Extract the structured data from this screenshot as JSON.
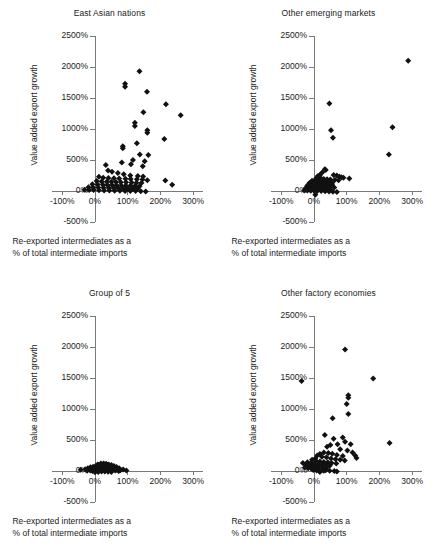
{
  "figure": {
    "background": "#ffffff",
    "marker_color": "#111111",
    "axis_color": "#7a7a7a",
    "panel_count": 4
  },
  "axis": {
    "xlabel_line1": "Re-exported intermediates as a",
    "xlabel_line2": "% of total intermediate imports",
    "ylabel": "Value added export growth",
    "xticks": [
      "-100%",
      "0%",
      "100%",
      "200%",
      "300%"
    ],
    "xtick_values": [
      -100,
      0,
      100,
      200,
      300
    ],
    "yticks": [
      "2500%",
      "2000%",
      "1500%",
      "1000%",
      "500%",
      "0%",
      "-500%"
    ],
    "ytick_values": [
      2500,
      2000,
      1500,
      1000,
      500,
      0,
      -500
    ],
    "xlim": [
      -130,
      330
    ],
    "ylim": [
      -500,
      2500
    ]
  },
  "chart_data": [
    {
      "type": "scatter",
      "title": "East Asian nations",
      "xlabel": "Re-exported intermediates as a % of total intermediate imports",
      "ylabel": "Value added export growth",
      "xlim": [
        -130,
        330
      ],
      "ylim": [
        -500,
        2500
      ],
      "grid": false,
      "legend": "none",
      "marker": "diamond",
      "points": [
        [
          136,
          1930
        ],
        [
          92,
          1730
        ],
        [
          92,
          1680
        ],
        [
          159,
          1600
        ],
        [
          217,
          1400
        ],
        [
          148,
          1270
        ],
        [
          122,
          1100
        ],
        [
          122,
          1050
        ],
        [
          262,
          1220
        ],
        [
          160,
          980
        ],
        [
          160,
          940
        ],
        [
          212,
          840
        ],
        [
          128,
          770
        ],
        [
          85,
          720
        ],
        [
          85,
          690
        ],
        [
          137,
          590
        ],
        [
          163,
          580
        ],
        [
          116,
          500
        ],
        [
          152,
          480
        ],
        [
          82,
          460
        ],
        [
          110,
          430
        ],
        [
          33,
          420
        ],
        [
          146,
          400
        ],
        [
          40,
          330
        ],
        [
          52,
          310
        ],
        [
          70,
          290
        ],
        [
          88,
          270
        ],
        [
          108,
          250
        ],
        [
          131,
          240
        ],
        [
          147,
          235
        ],
        [
          12,
          230
        ],
        [
          25,
          215
        ],
        [
          41,
          210
        ],
        [
          58,
          205
        ],
        [
          74,
          200
        ],
        [
          93,
          198
        ],
        [
          109,
          195
        ],
        [
          128,
          190
        ],
        [
          145,
          185
        ],
        [
          160,
          175
        ],
        [
          215,
          170
        ],
        [
          5,
          160
        ],
        [
          20,
          155
        ],
        [
          36,
          150
        ],
        [
          50,
          148
        ],
        [
          64,
          145
        ],
        [
          79,
          142
        ],
        [
          95,
          140
        ],
        [
          112,
          138
        ],
        [
          127,
          135
        ],
        [
          142,
          130
        ],
        [
          236,
          100
        ],
        [
          -8,
          110
        ],
        [
          8,
          105
        ],
        [
          24,
          100
        ],
        [
          38,
          98
        ],
        [
          52,
          95
        ],
        [
          66,
          92
        ],
        [
          80,
          90
        ],
        [
          94,
          88
        ],
        [
          108,
          85
        ],
        [
          122,
          82
        ],
        [
          136,
          78
        ],
        [
          -20,
          60
        ],
        [
          -6,
          58
        ],
        [
          10,
          55
        ],
        [
          26,
          52
        ],
        [
          42,
          50
        ],
        [
          57,
          48
        ],
        [
          71,
          45
        ],
        [
          86,
          42
        ],
        [
          100,
          40
        ],
        [
          115,
          38
        ],
        [
          130,
          35
        ],
        [
          -32,
          20
        ],
        [
          -18,
          18
        ],
        [
          -4,
          15
        ],
        [
          12,
          12
        ],
        [
          28,
          10
        ],
        [
          44,
          8
        ],
        [
          60,
          5
        ],
        [
          76,
          4
        ],
        [
          92,
          2
        ],
        [
          108,
          0
        ],
        [
          124,
          -2
        ],
        [
          140,
          -5
        ],
        [
          155,
          -10
        ]
      ]
    },
    {
      "type": "scatter",
      "title": "Other emerging markets",
      "xlabel": "Re-exported intermediates as a % of total intermediate imports",
      "ylabel": "Value added export growth",
      "xlim": [
        -130,
        330
      ],
      "ylim": [
        -500,
        2500
      ],
      "grid": false,
      "legend": "none",
      "marker": "diamond",
      "points": [
        [
          288,
          2100
        ],
        [
          47,
          1410
        ],
        [
          240,
          1030
        ],
        [
          52,
          980
        ],
        [
          58,
          860
        ],
        [
          229,
          590
        ],
        [
          108,
          200
        ],
        [
          33,
          350
        ],
        [
          36,
          340
        ],
        [
          78,
          230
        ],
        [
          84,
          220
        ],
        [
          90,
          215
        ],
        [
          70,
          250
        ],
        [
          60,
          260
        ],
        [
          25,
          300
        ],
        [
          18,
          260
        ],
        [
          12,
          240
        ],
        [
          8,
          215
        ],
        [
          14,
          205
        ],
        [
          22,
          200
        ],
        [
          30,
          195
        ],
        [
          40,
          190
        ],
        [
          50,
          185
        ],
        [
          64,
          180
        ],
        [
          75,
          175
        ],
        [
          2,
          175
        ],
        [
          -6,
          165
        ],
        [
          6,
          160
        ],
        [
          16,
          155
        ],
        [
          26,
          150
        ],
        [
          36,
          145
        ],
        [
          46,
          140
        ],
        [
          56,
          135
        ],
        [
          -14,
          130
        ],
        [
          -4,
          125
        ],
        [
          8,
          120
        ],
        [
          20,
          115
        ],
        [
          32,
          110
        ],
        [
          44,
          105
        ],
        [
          55,
          100
        ],
        [
          -20,
          90
        ],
        [
          -10,
          85
        ],
        [
          0,
          80
        ],
        [
          12,
          75
        ],
        [
          24,
          70
        ],
        [
          36,
          65
        ],
        [
          48,
          60
        ],
        [
          62,
          55
        ],
        [
          -26,
          45
        ],
        [
          -16,
          40
        ],
        [
          -6,
          35
        ],
        [
          4,
          32
        ],
        [
          16,
          28
        ],
        [
          28,
          25
        ],
        [
          40,
          22
        ],
        [
          52,
          18
        ],
        [
          -30,
          10
        ],
        [
          -20,
          8
        ],
        [
          -10,
          5
        ],
        [
          0,
          3
        ],
        [
          10,
          0
        ],
        [
          22,
          -2
        ],
        [
          34,
          -5
        ],
        [
          46,
          -8
        ],
        [
          58,
          -12
        ],
        [
          70,
          -15
        ],
        [
          4,
          -60
        ]
      ]
    },
    {
      "type": "scatter",
      "title": "Group of 5",
      "xlabel": "Re-exported intermediates as a % of total intermediate imports",
      "ylabel": "Value added export growth",
      "xlim": [
        -130,
        330
      ],
      "ylim": [
        -500,
        2500
      ],
      "grid": false,
      "legend": "none",
      "marker": "diamond",
      "points": [
        [
          -44,
          20
        ],
        [
          -30,
          30
        ],
        [
          -22,
          45
        ],
        [
          -14,
          60
        ],
        [
          -6,
          70
        ],
        [
          2,
          80
        ],
        [
          10,
          95
        ],
        [
          18,
          110
        ],
        [
          26,
          120
        ],
        [
          34,
          115
        ],
        [
          42,
          105
        ],
        [
          50,
          95
        ],
        [
          58,
          80
        ],
        [
          66,
          65
        ],
        [
          74,
          45
        ],
        [
          86,
          25
        ],
        [
          96,
          10
        ],
        [
          -18,
          25
        ],
        [
          -10,
          35
        ],
        [
          -2,
          50
        ],
        [
          6,
          62
        ],
        [
          14,
          75
        ],
        [
          22,
          88
        ],
        [
          30,
          92
        ],
        [
          38,
          85
        ],
        [
          46,
          72
        ],
        [
          54,
          58
        ],
        [
          62,
          42
        ],
        [
          70,
          28
        ],
        [
          78,
          15
        ],
        [
          -24,
          5
        ],
        [
          -14,
          10
        ],
        [
          -4,
          18
        ],
        [
          6,
          28
        ],
        [
          16,
          40
        ],
        [
          26,
          52
        ],
        [
          36,
          60
        ],
        [
          46,
          50
        ],
        [
          56,
          38
        ],
        [
          66,
          22
        ],
        [
          76,
          8
        ],
        [
          -8,
          0
        ],
        [
          2,
          5
        ],
        [
          12,
          15
        ],
        [
          22,
          25
        ],
        [
          32,
          35
        ],
        [
          42,
          30
        ],
        [
          52,
          20
        ],
        [
          62,
          10
        ],
        [
          72,
          0
        ],
        [
          0,
          -20
        ],
        [
          10,
          -15
        ],
        [
          20,
          -10
        ],
        [
          30,
          -8
        ],
        [
          40,
          -12
        ],
        [
          50,
          -18
        ],
        [
          8,
          105
        ],
        [
          18,
          120
        ],
        [
          28,
          108
        ],
        [
          38,
          96
        ]
      ]
    },
    {
      "type": "scatter",
      "title": "Other factory economies",
      "xlabel": "Re-exported intermediates as a % of total intermediate imports",
      "ylabel": "Value added export growth",
      "xlim": [
        -130,
        330
      ],
      "ylim": [
        -500,
        2500
      ],
      "grid": false,
      "legend": "none",
      "marker": "diamond",
      "points": [
        [
          95,
          1960
        ],
        [
          181,
          1490
        ],
        [
          -38,
          1450
        ],
        [
          105,
          1220
        ],
        [
          105,
          1180
        ],
        [
          100,
          1080
        ],
        [
          57,
          850
        ],
        [
          105,
          920
        ],
        [
          33,
          580
        ],
        [
          231,
          450
        ],
        [
          60,
          520
        ],
        [
          88,
          540
        ],
        [
          95,
          470
        ],
        [
          112,
          430
        ],
        [
          72,
          430
        ],
        [
          50,
          420
        ],
        [
          40,
          390
        ],
        [
          80,
          350
        ],
        [
          102,
          330
        ],
        [
          118,
          300
        ],
        [
          126,
          250
        ],
        [
          130,
          210
        ],
        [
          88,
          240
        ],
        [
          70,
          260
        ],
        [
          56,
          280
        ],
        [
          44,
          290
        ],
        [
          30,
          300
        ],
        [
          18,
          275
        ],
        [
          10,
          250
        ],
        [
          24,
          230
        ],
        [
          38,
          220
        ],
        [
          52,
          200
        ],
        [
          66,
          190
        ],
        [
          80,
          180
        ],
        [
          94,
          170
        ],
        [
          4,
          200
        ],
        [
          -6,
          180
        ],
        [
          6,
          165
        ],
        [
          18,
          155
        ],
        [
          30,
          145
        ],
        [
          42,
          140
        ],
        [
          54,
          130
        ],
        [
          68,
          120
        ],
        [
          -20,
          140
        ],
        [
          -10,
          125
        ],
        [
          0,
          115
        ],
        [
          12,
          105
        ],
        [
          24,
          98
        ],
        [
          36,
          92
        ],
        [
          48,
          85
        ],
        [
          -34,
          130
        ],
        [
          -26,
          100
        ],
        [
          -16,
          88
        ],
        [
          -6,
          78
        ],
        [
          4,
          70
        ],
        [
          14,
          62
        ],
        [
          26,
          55
        ],
        [
          38,
          48
        ],
        [
          -28,
          55
        ],
        [
          -18,
          45
        ],
        [
          -8,
          38
        ],
        [
          2,
          30
        ],
        [
          12,
          25
        ],
        [
          24,
          18
        ],
        [
          36,
          12
        ],
        [
          48,
          5
        ],
        [
          62,
          0
        ],
        [
          70,
          -10
        ],
        [
          18,
          -15
        ],
        [
          8,
          8
        ],
        [
          -2,
          15
        ],
        [
          30,
          5
        ]
      ]
    }
  ]
}
